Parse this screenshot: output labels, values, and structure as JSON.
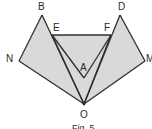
{
  "figure": {
    "caption": "Fig. 5",
    "colors": {
      "fill": "#d9d9d9",
      "stroke": "#2e2e2e",
      "background": "#ffffff"
    },
    "points": {
      "B": {
        "label": "B",
        "x": 42,
        "y": 15
      },
      "D": {
        "label": "D",
        "x": 120,
        "y": 15
      },
      "E": {
        "label": "E",
        "x": 52,
        "y": 35
      },
      "F": {
        "label": "F",
        "x": 111,
        "y": 35
      },
      "N": {
        "label": "N",
        "x": 19,
        "y": 61
      },
      "M": {
        "label": "M",
        "x": 145,
        "y": 61
      },
      "A": {
        "label": "A",
        "x": 84,
        "y": 78
      },
      "O": {
        "label": "O",
        "x": 84,
        "y": 104
      }
    },
    "labels": {
      "B": "B",
      "D": "D",
      "E": "E",
      "F": "F",
      "N": "N",
      "M": "M",
      "A": "A",
      "O": "O"
    },
    "segments": [
      "BN",
      "NO",
      "BO",
      "DM",
      "MO",
      "DO",
      "EF",
      "EO",
      "FO",
      "EA",
      "FA"
    ],
    "shaded_regions": [
      "BNO",
      "DMO",
      "EFO"
    ]
  }
}
